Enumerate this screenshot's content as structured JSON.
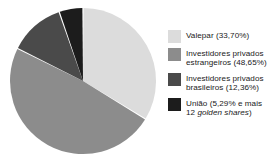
{
  "chart_data": {
    "type": "pie",
    "title": "",
    "subtitle": "",
    "xlabel": "",
    "ylabel": "",
    "grid": false,
    "legend_position": "right",
    "start_angle_deg": 0,
    "direction": "clockwise",
    "categories": [
      "Valepar",
      "Investidores privados estrangeiros",
      "Investidores privados brasileiros",
      "União"
    ],
    "values": [
      33.7,
      48.65,
      12.36,
      5.29
    ],
    "value_unit": "%",
    "colors": [
      "#dcdcdc",
      "#8c8c8c",
      "#4a4a4a",
      "#1c1c1c"
    ],
    "slice_separator_color": "#ffffff",
    "slices": [
      {
        "name": "Valepar",
        "value": 33.7,
        "color": "#dcdcdc",
        "legend_text": "Valepar (33,70%)"
      },
      {
        "name": "Investidores privados estrangeiros",
        "value": 48.65,
        "color": "#8c8c8c",
        "legend_text": "Investidores privados estrangeiros (48,65%)"
      },
      {
        "name": "Investidores privados brasileiros",
        "value": 12.36,
        "color": "#4a4a4a",
        "legend_text": "Investidores privados brasileiros (12,36%)"
      },
      {
        "name": "União",
        "value": 5.29,
        "color": "#1c1c1c",
        "legend_text": "União (5,29% e mais 12 golden shares)"
      }
    ]
  },
  "legend": {
    "items": [
      {
        "swatch_color": "#dcdcdc",
        "line1": "Valepar (33,70%)",
        "line2": "",
        "line2_italic_part": ""
      },
      {
        "swatch_color": "#8c8c8c",
        "line1": "Investidores privados",
        "line2": "estrangeiros (48,65%)",
        "line2_italic_part": ""
      },
      {
        "swatch_color": "#4a4a4a",
        "line1": "Investidores privados",
        "line2": "brasileiros (12,36%)",
        "line2_italic_part": ""
      },
      {
        "swatch_color": "#1c1c1c",
        "line1": "União (5,29% e mais",
        "line2_prefix": "12 ",
        "line2_italic_part": "golden shares",
        "line2_suffix": ")"
      }
    ]
  }
}
